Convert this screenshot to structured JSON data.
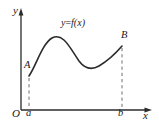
{
  "figure": {
    "kind": "cartesian-plot",
    "background": "#ffffff",
    "stroke_color": "#2b2b2b",
    "axes": {
      "y_label": "y",
      "x_label": "x",
      "origin_label": "O",
      "y_axis": {
        "x": 21,
        "y_top": 12,
        "y_bottom": 110,
        "arrow": "up"
      },
      "x_axis": {
        "y": 110,
        "x_left": 21,
        "x_right": 150,
        "arrow": "right"
      }
    },
    "ticks": [
      {
        "name": "a",
        "label": "a",
        "x": 29
      },
      {
        "name": "b",
        "label": "b",
        "x": 122
      }
    ],
    "points": [
      {
        "name": "A",
        "label": "A",
        "x": 29,
        "y": 76
      },
      {
        "name": "B",
        "label": "B",
        "x": 122,
        "y": 46
      }
    ],
    "curve": {
      "label": "y=f(x)",
      "label_lhs": "y",
      "label_eq": "=",
      "label_rhs": "f(x)",
      "path": "M 29 76 C 36 66, 42 44, 52 38 C 63 32, 70 48, 79 61 C 85 69, 92 70, 99 66 C 109 60, 116 53, 122 46"
    },
    "dashed_lines": [
      {
        "name": "dashed-a",
        "x": 29,
        "y_from": 76,
        "y_to": 110
      },
      {
        "name": "dashed-b",
        "x": 122,
        "y_from": 46,
        "y_to": 110
      }
    ]
  }
}
